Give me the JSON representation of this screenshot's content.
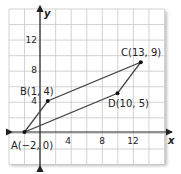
{
  "figure": {
    "type": "coordinate-plane-parallelogram",
    "axes": {
      "x_label": "x",
      "y_label": "y",
      "x_ticks": [
        "4",
        "8",
        "12"
      ],
      "y_ticks": [
        "4",
        "8",
        "12"
      ],
      "x_range": [
        -4,
        16
      ],
      "y_range": [
        -4,
        16
      ],
      "grid_step": 2
    },
    "points": [
      {
        "name": "A",
        "label": "A(−2, 0)",
        "x": -2,
        "y": 0
      },
      {
        "name": "B",
        "label": "B(1, 4)",
        "x": 1,
        "y": 4
      },
      {
        "name": "C",
        "label": "C(13, 9)",
        "x": 13,
        "y": 9
      },
      {
        "name": "D",
        "label": "D(10, 5)",
        "x": 10,
        "y": 5
      }
    ],
    "segments": [
      [
        "A",
        "B"
      ],
      [
        "B",
        "C"
      ],
      [
        "C",
        "D"
      ],
      [
        "D",
        "A"
      ]
    ],
    "colors": {
      "grid": "#c8c8c8",
      "axis": "#222222",
      "polygon": "#444444",
      "point": "#111111"
    }
  }
}
